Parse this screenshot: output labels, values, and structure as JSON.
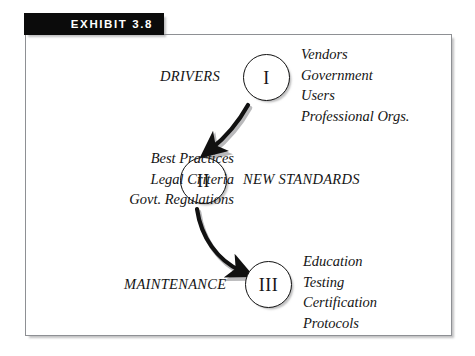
{
  "exhibit": {
    "number_label": "EXHIBIT 3.8"
  },
  "diagram": {
    "nodes": [
      {
        "id": "node-1",
        "roman": "I",
        "stage_label": "DRIVERS"
      },
      {
        "id": "node-2",
        "roman": "II",
        "stage_label": "NEW STANDARDS"
      },
      {
        "id": "node-3",
        "roman": "III",
        "stage_label": "MAINTENANCE"
      }
    ],
    "lists": {
      "drivers": {
        "line1": "Vendors",
        "line2": "Government",
        "line3": "Users",
        "line4": "Professional Orgs."
      },
      "standards": {
        "line1": "Best Practices",
        "line2": "Legal Criteria",
        "line3": "Govt. Regulations"
      },
      "maintenance": {
        "line1": "Education",
        "line2": "Testing",
        "line3": "Certification",
        "line4": "Protocols"
      }
    },
    "colors": {
      "ink": "#111111",
      "bar_background": "#0b0b0b",
      "bar_text": "#ffffff",
      "frame_border": "#8e9094",
      "page_background": "#ffffff"
    }
  }
}
